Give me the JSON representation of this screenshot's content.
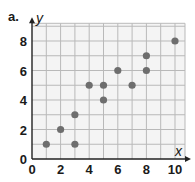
{
  "panel_label": "a.",
  "chart_data": {
    "type": "scatter",
    "title": "",
    "xlabel": "x",
    "ylabel": "y",
    "xlim": [
      0,
      10.7
    ],
    "ylim": [
      0,
      9.2
    ],
    "grid": true,
    "xticks": [
      0,
      2,
      4,
      6,
      8,
      10
    ],
    "yticks": [
      0,
      2,
      4,
      6,
      8
    ],
    "points": [
      {
        "x": 1,
        "y": 1
      },
      {
        "x": 2,
        "y": 2
      },
      {
        "x": 3,
        "y": 3
      },
      {
        "x": 3,
        "y": 1
      },
      {
        "x": 4,
        "y": 5
      },
      {
        "x": 5,
        "y": 5
      },
      {
        "x": 5,
        "y": 4
      },
      {
        "x": 6,
        "y": 6
      },
      {
        "x": 7,
        "y": 5
      },
      {
        "x": 8,
        "y": 7
      },
      {
        "x": 8,
        "y": 6
      },
      {
        "x": 10,
        "y": 8
      }
    ],
    "colors": {
      "point": "#6e6e6e",
      "grid": "#b9b9b9",
      "plot_bg": "#f4f4f4",
      "axis": "#222222"
    }
  }
}
